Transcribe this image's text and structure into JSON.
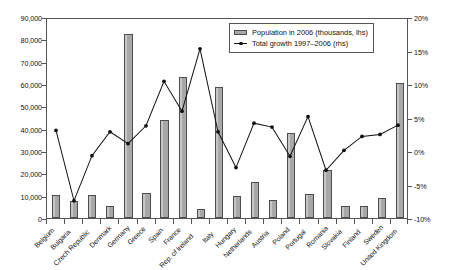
{
  "chart_data": {
    "type": "bar",
    "title": "",
    "subtitle": "",
    "xlabel": "",
    "ylabel": "",
    "y2label": "",
    "grid": false,
    "legend_position": "top-right",
    "categories": [
      "Belgium",
      "Bulgaria",
      "Czech Republic",
      "Denmark",
      "Germany",
      "Greece",
      "Spain",
      "France",
      "Rep. of Ireland",
      "Italy",
      "Hungary",
      "Netherlands",
      "Austria",
      "Poland",
      "Portugal",
      "Romania",
      "Slovakia",
      "Finland",
      "Sweden",
      "United Kingdom"
    ],
    "ylim": [
      0,
      90000
    ],
    "yticks": [
      "0",
      "10,000",
      "20,000",
      "30,000",
      "40,000",
      "50,000",
      "60,000",
      "70,000",
      "80,000",
      "90,000"
    ],
    "y2lim": [
      -10,
      20
    ],
    "y2ticks": [
      "-10%",
      "-5%",
      "0%",
      "5%",
      "10%",
      "15%",
      "20%"
    ],
    "series": [
      {
        "name": "Population in 2006 (thousands, lhs)",
        "axis": "left",
        "type": "bar",
        "values": [
          10500,
          7700,
          10250,
          5430,
          82400,
          11100,
          43750,
          63000,
          4210,
          58750,
          10070,
          16330,
          8270,
          38150,
          10570,
          21600,
          5390,
          5260,
          9080,
          60500
        ]
      },
      {
        "name": "Total growth 1997–2006 (rhs)",
        "axis": "right",
        "type": "line",
        "values": [
          3.2,
          -7.4,
          -0.6,
          3.0,
          1.2,
          3.9,
          10.6,
          6.1,
          15.5,
          3.0,
          -2.4,
          4.3,
          3.7,
          -0.7,
          5.3,
          -2.8,
          0.2,
          2.3,
          2.6,
          4.0
        ]
      }
    ]
  },
  "legend": {
    "bar_label": "Population in 2006 (thousands, lhs)",
    "line_label": "Total growth 1997–2006 (rhs)"
  }
}
